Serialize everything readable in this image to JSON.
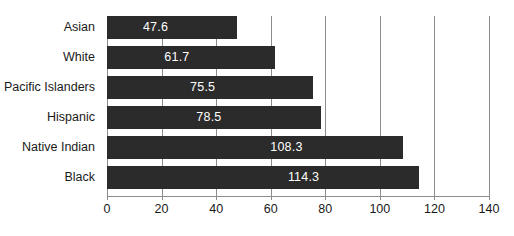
{
  "chart_data": {
    "type": "bar",
    "orientation": "horizontal",
    "title": "",
    "subtitle": "",
    "xlabel": "",
    "ylabel": "",
    "categories": [
      "Asian",
      "White",
      "Pacific Islanders",
      "Hispanic",
      "Native Indian",
      "Black"
    ],
    "values": [
      47.6,
      61.7,
      75.5,
      78.5,
      108.3,
      114.3
    ],
    "value_labels": [
      "47.6",
      "61.7",
      "75.5",
      "78.5",
      "108.3",
      "114.3"
    ],
    "xlim": [
      0,
      140
    ],
    "xticks": [
      0,
      20,
      40,
      60,
      80,
      100,
      120,
      140
    ],
    "xtick_labels": [
      "0",
      "20",
      "40",
      "60",
      "80",
      "100",
      "120",
      "140"
    ],
    "grid": true,
    "grid_axis": "x",
    "legend": false,
    "legend_position": "none",
    "bar_color": "#2b2b2b",
    "value_label_color": "#ffffff",
    "grid_color": "#8c8c8c",
    "background_color": "#ffffff",
    "text_color": "#1a1a1a"
  }
}
